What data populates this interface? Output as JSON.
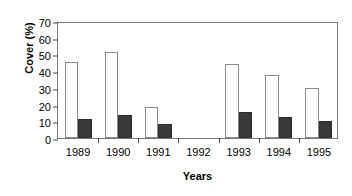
{
  "chart_data": {
    "type": "bar",
    "title": "",
    "xlabel": "Years",
    "ylabel": "Cover (%)",
    "categories": [
      "1989",
      "1990",
      "1991",
      "1992",
      "1993",
      "1994",
      "1995"
    ],
    "yticks": [
      0,
      10,
      20,
      30,
      40,
      50,
      60,
      70
    ],
    "ylim": [
      0,
      70
    ],
    "grid": false,
    "legend": "none",
    "series": [
      {
        "name": "open-bars",
        "color": "#ffffff",
        "values": [
          45.5,
          51.5,
          18.7,
          null,
          44.0,
          37.7,
          30.0
        ]
      },
      {
        "name": "filled-bars",
        "color": "#3a3a3a",
        "values": [
          11.5,
          14.0,
          8.3,
          null,
          15.7,
          12.7,
          10.0
        ]
      }
    ]
  }
}
